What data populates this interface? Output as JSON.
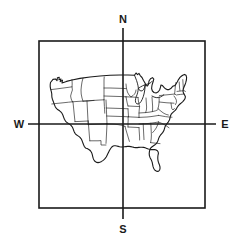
{
  "figure": {
    "type": "line-art-map",
    "background_color": "#ffffff",
    "line_color": "#1a1a1a",
    "frame": {
      "x": 39,
      "y": 41,
      "width": 166,
      "height": 167,
      "stroke_width": 1.6
    },
    "crosshair": {
      "center_x": 123,
      "center_y": 124,
      "vertical_line": {
        "x": 123,
        "y_top": 28,
        "y_bottom": 219
      },
      "horizontal_line": {
        "y": 124,
        "x_left": 28,
        "x_right": 216
      },
      "stroke_width": 1.6
    }
  },
  "compass": {
    "north": "N",
    "south": "S",
    "west": "W",
    "east": "E"
  },
  "map": {
    "region": "Contiguous United States",
    "features": "national outline with internal state boundaries",
    "outline_stroke_width": 1.1,
    "state_stroke_width": 0.7
  }
}
